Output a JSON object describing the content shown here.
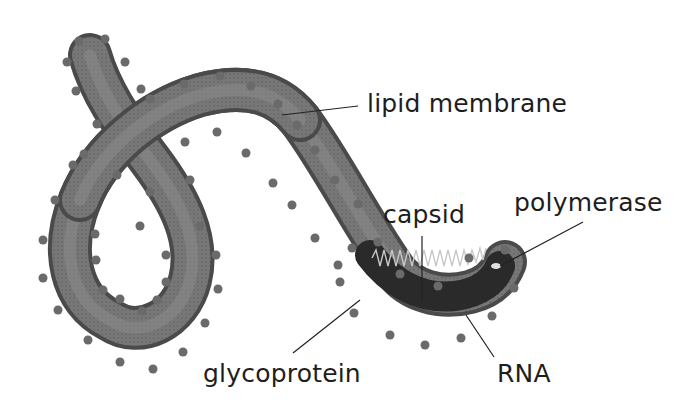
{
  "diagram": {
    "labels": {
      "lipid_membrane": "lipid membrane",
      "capsid": "capsid",
      "polymerase": "polymerase",
      "glycoprotein": "glycoprotein",
      "rna": "RNA"
    },
    "colors": {
      "membrane_outer": "#4a4a4a",
      "membrane_fill": "#7a7a7a",
      "membrane_highlight": "#8e8e8e",
      "spike": "#6a6a6a",
      "capsid_dark": "#2a2a2a",
      "rna_coil": "#c8c8c8",
      "leader_line": "#222222",
      "text": "#1e1e1e"
    }
  }
}
